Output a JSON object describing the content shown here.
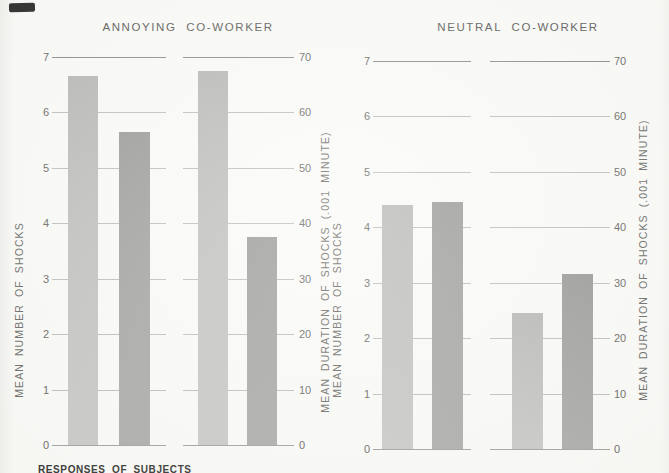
{
  "figure": {
    "caption": "RESPONSES OF SUBJECTS",
    "background": "#fafaf7"
  },
  "palette": {
    "bar_light": "#c5c6c3",
    "bar_dark": "#a6a7a4",
    "grid": "#c0c0bc",
    "grid_strong": "#8f8f8b",
    "text": "#6d6d6a",
    "title_text": "#5f5f5c",
    "artifact": "#1f1f1d"
  },
  "chart_data": [
    {
      "type": "bar",
      "title": "ANNOYING CO-WORKER",
      "left_axis": {
        "label": "MEAN NUMBER OF SHOCKS",
        "range": [
          0,
          7
        ],
        "ticks": [
          0,
          1,
          2,
          3,
          4,
          5,
          6,
          7
        ]
      },
      "right_axis": {
        "label": "MEAN DURATION OF SHOCKS (.001 MINUTE)",
        "range": [
          0,
          70
        ],
        "ticks": [
          0,
          10,
          20,
          30,
          40,
          50,
          60,
          70
        ]
      },
      "grid": "on",
      "series": [
        {
          "name": "number-of-shocks",
          "axis": "left",
          "bars": [
            {
              "shade": "light",
              "value": 6.65
            },
            {
              "shade": "dark",
              "value": 5.65
            }
          ]
        },
        {
          "name": "duration-of-shocks",
          "axis": "right",
          "bars": [
            {
              "shade": "light",
              "value": 67.5
            },
            {
              "shade": "dark",
              "value": 37.5
            }
          ]
        }
      ]
    },
    {
      "type": "bar",
      "title": "NEUTRAL CO-WORKER",
      "left_axis": {
        "label": "MEAN NUMBER OF SHOCKS",
        "range": [
          0,
          7
        ],
        "ticks": [
          0,
          1,
          2,
          3,
          4,
          5,
          6,
          7
        ]
      },
      "right_axis": {
        "label": "MEAN DURATION OF SHOCKS (.001 MINUTE)",
        "range": [
          0,
          70
        ],
        "ticks": [
          0,
          10,
          20,
          30,
          40,
          50,
          60,
          70
        ]
      },
      "grid": "on",
      "series": [
        {
          "name": "number-of-shocks",
          "axis": "left",
          "bars": [
            {
              "shade": "light",
              "value": 4.4
            },
            {
              "shade": "dark",
              "value": 4.45
            }
          ]
        },
        {
          "name": "duration-of-shocks",
          "axis": "right",
          "bars": [
            {
              "shade": "light",
              "value": 24.5
            },
            {
              "shade": "dark",
              "value": 31.5
            }
          ]
        }
      ]
    }
  ]
}
